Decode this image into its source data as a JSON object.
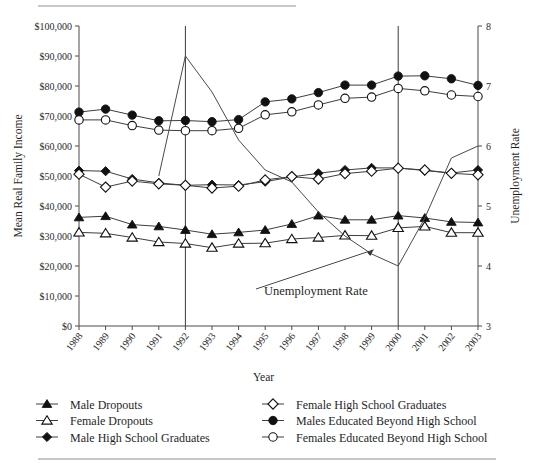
{
  "chart_data": {
    "type": "line",
    "title": "",
    "xlabel": "Year",
    "ylabel": "Mean Real Family Income",
    "y2label": "Unemployment Rate",
    "categories": [
      "1988",
      "1989",
      "1990",
      "1991",
      "1992",
      "1993",
      "1994",
      "1995",
      "1996",
      "1997",
      "1998",
      "1999",
      "2000",
      "2001",
      "2002",
      "2003"
    ],
    "ylim": [
      0,
      100000
    ],
    "y2lim": [
      3,
      8
    ],
    "yticks": [
      "$0",
      "$10,000",
      "$20,000",
      "$30,000",
      "$40,000",
      "$50,000",
      "$60,000",
      "$70,000",
      "$80,000",
      "$90,000",
      "$100,000"
    ],
    "y2ticks": [
      "3",
      "4",
      "5",
      "6",
      "7",
      "8"
    ],
    "grid": false,
    "legend_position": "bottom",
    "vertical_reference_lines": [
      "1992",
      "2000"
    ],
    "annotations": [
      {
        "text": "Unemployment Rate",
        "points_to": "1999"
      }
    ],
    "series": [
      {
        "name": "Male Dropouts",
        "marker": "filled-triangle",
        "axis": "left",
        "values": [
          36200,
          36600,
          33800,
          33200,
          32000,
          30600,
          31200,
          32000,
          34000,
          36800,
          35400,
          35400,
          36800,
          36000,
          34700,
          34500
        ]
      },
      {
        "name": "Female Dropouts",
        "marker": "open-triangle",
        "axis": "left",
        "values": [
          31200,
          30900,
          29500,
          28000,
          27500,
          26100,
          27500,
          27600,
          29000,
          29500,
          30200,
          30100,
          32700,
          33200,
          31100,
          31100
        ]
      },
      {
        "name": "Male High School Graduates",
        "marker": "filled-diamond",
        "axis": "left",
        "values": [
          51800,
          51600,
          49000,
          47700,
          46900,
          47100,
          47000,
          48100,
          49700,
          50900,
          52000,
          52700,
          52700,
          51800,
          51000,
          52000
        ]
      },
      {
        "name": "Female High School Graduates",
        "marker": "open-diamond",
        "axis": "left",
        "values": [
          50600,
          46300,
          48300,
          47400,
          46900,
          46000,
          46600,
          48700,
          49800,
          49000,
          50800,
          51600,
          52600,
          52000,
          50900,
          50400
        ]
      },
      {
        "name": "Males Educated Beyond High School",
        "marker": "filled-circle",
        "axis": "left",
        "values": [
          71300,
          72300,
          70300,
          68400,
          68500,
          68100,
          68800,
          74700,
          75700,
          77800,
          80300,
          80300,
          83300,
          83400,
          82400,
          80200
        ]
      },
      {
        "name": "Females Educated Beyond High School",
        "marker": "open-circle",
        "axis": "left",
        "values": [
          68700,
          68700,
          66800,
          65300,
          65100,
          65100,
          65900,
          70400,
          71400,
          73700,
          75900,
          76300,
          79200,
          78400,
          77000,
          76500
        ]
      },
      {
        "name": "Unemployment Rate",
        "marker": "none",
        "axis": "right",
        "values": [
          null,
          null,
          null,
          5.5,
          7.5,
          6.9,
          6.1,
          5.6,
          5.4,
          4.9,
          4.5,
          4.2,
          4.0,
          4.8,
          5.8,
          6.0
        ]
      }
    ]
  },
  "legend": {
    "items": [
      {
        "label": "Male Dropouts",
        "marker": "filled-triangle"
      },
      {
        "label": "Female Dropouts",
        "marker": "open-triangle"
      },
      {
        "label": "Male High School Graduates",
        "marker": "filled-diamond"
      },
      {
        "label": "Female High School Graduates",
        "marker": "open-diamond"
      },
      {
        "label": "Males Educated Beyond High School",
        "marker": "filled-circle"
      },
      {
        "label": "Females Educated Beyond High School",
        "marker": "open-circle"
      }
    ]
  }
}
